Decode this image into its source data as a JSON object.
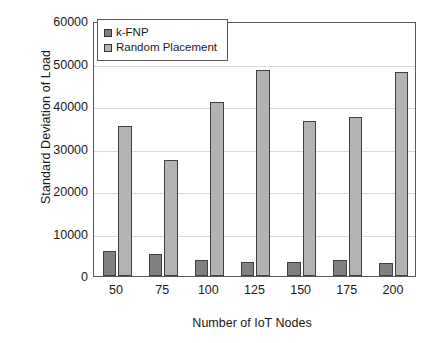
{
  "chart_data": {
    "type": "bar",
    "title": "",
    "xlabel": "Number of IoT Nodes",
    "ylabel": "Standard Deviation of Load",
    "categories": [
      "50",
      "75",
      "100",
      "125",
      "150",
      "175",
      "200"
    ],
    "series": [
      {
        "name": "k-FNP",
        "color": "#808080",
        "values": [
          5800,
          5100,
          3700,
          3200,
          3200,
          3700,
          3100
        ]
      },
      {
        "name": "Random Placement",
        "color": "#b3b3b3",
        "values": [
          35300,
          27300,
          41000,
          48400,
          36400,
          37300,
          48100
        ]
      }
    ],
    "ylim": [
      0,
      60000
    ],
    "yticks": [
      0,
      10000,
      20000,
      30000,
      40000,
      50000,
      60000
    ],
    "ytick_labels": [
      "0",
      "10000",
      "20000",
      "30000",
      "40000",
      "50000",
      "60000"
    ],
    "grid": true,
    "grid_axis": "y",
    "legend_position": "top-left",
    "frame": true
  },
  "legend": {
    "entries": [
      {
        "label": "k-FNP",
        "swatch": "legend-swatch-k-fnp"
      },
      {
        "label": "Random Placement",
        "swatch": "legend-swatch-random-placement"
      }
    ]
  },
  "colors": {
    "series_k_fnp": "#808080",
    "series_random_placement": "#b3b3b3",
    "bar_outline": "#404040",
    "frame": "#595959",
    "gridline": "#d9d9d9",
    "text": "#1a1a1a",
    "background": "#ffffff"
  }
}
